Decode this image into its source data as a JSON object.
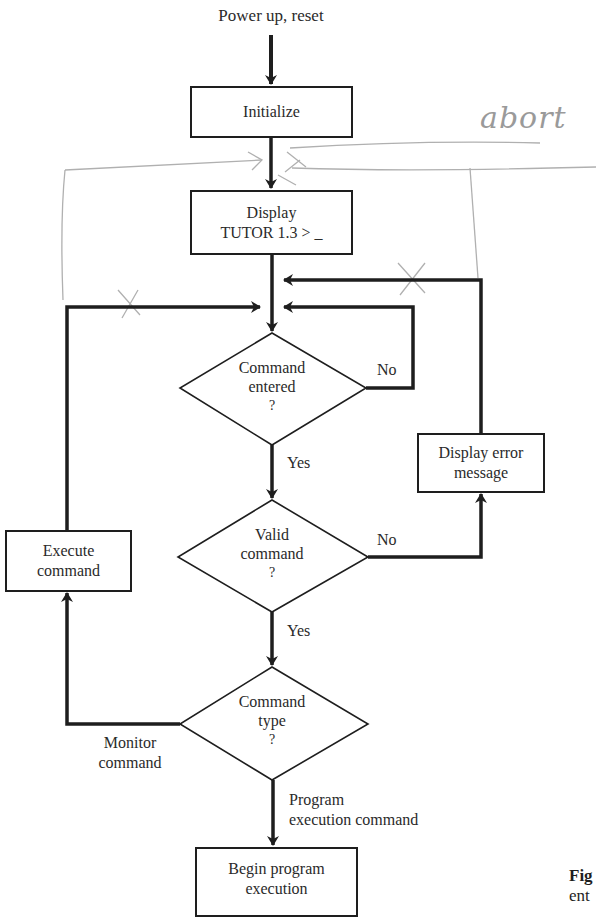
{
  "diagram": {
    "type": "flowchart",
    "start_label": "Power up, reset",
    "nodes": {
      "initialize": "Initialize",
      "display_prompt_line1": "Display",
      "display_prompt_line2": "TUTOR 1.3 > _",
      "decision_entered_line1": "Command",
      "decision_entered_line2": "entered",
      "decision_entered_line3": "?",
      "display_error_line1": "Display error",
      "display_error_line2": "message",
      "decision_valid_line1": "Valid",
      "decision_valid_line2": "command",
      "decision_valid_line3": "?",
      "execute_line1": "Execute",
      "execute_line2": "command",
      "decision_type_line1": "Command",
      "decision_type_line2": "type",
      "decision_type_line3": "?",
      "begin_line1": "Begin program",
      "begin_line2": "execution"
    },
    "edge_labels": {
      "entered_no": "No",
      "entered_yes": "Yes",
      "valid_no": "No",
      "valid_yes": "Yes",
      "monitor_line1": "Monitor",
      "monitor_line2": "command",
      "program_line1": "Program",
      "program_line2": "execution command"
    },
    "annotations": {
      "handwritten": "abort",
      "cross_marks": [
        "X",
        "X"
      ]
    },
    "caption_fragment": {
      "bold": "Fig",
      "text": "ent"
    },
    "colors": {
      "ink": "#1e1e1e",
      "pencil": "#a8a8a8",
      "background": "#ffffff"
    }
  }
}
